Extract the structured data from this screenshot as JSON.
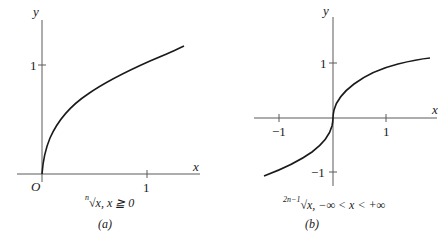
{
  "panels": [
    {
      "id": "a",
      "label": "(a)",
      "axis_x_label": "x",
      "axis_y_label": "y",
      "origin_label": "O",
      "x_ticks": [
        "1"
      ],
      "y_ticks": [
        "1"
      ],
      "caption_index": "n",
      "caption_radical": "√",
      "caption_rest": "x, x ≧ 0",
      "function": "y = x^(1/n), x ≥ 0"
    },
    {
      "id": "b",
      "label": "(b)",
      "axis_x_label": "x",
      "axis_y_label": "y",
      "x_ticks": [
        "−1",
        "1"
      ],
      "y_ticks": [
        "1",
        "−1"
      ],
      "caption_index": "2n−1",
      "caption_radical": "√",
      "caption_rest": "x, −∞ < x < +∞",
      "function": "y = x^(1/(2n−1)), −∞ < x < +∞"
    }
  ],
  "colors": {
    "ink": "#1a1a1a",
    "axis": "#555555",
    "background": "#ffffff"
  }
}
